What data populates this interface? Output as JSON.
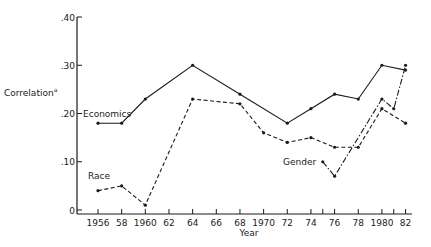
{
  "chart_data": {
    "type": "line",
    "title": "",
    "xlabel": "Year",
    "ylabel": "Correlation",
    "ylabel_superscript": "a",
    "ylim": [
      0,
      0.4
    ],
    "xlim": [
      1954.5,
      1982.5
    ],
    "grid": false,
    "legend_position": "inline labels",
    "y_ticks": [
      {
        "value": 0,
        "label": "0"
      },
      {
        "value": 0.1,
        "label": ".10"
      },
      {
        "value": 0.2,
        "label": ".20"
      },
      {
        "value": 0.3,
        "label": ".30"
      },
      {
        "value": 0.4,
        "label": ".40"
      }
    ],
    "x_ticks": [
      {
        "value": 1956,
        "label": "1956"
      },
      {
        "value": 1958,
        "label": "58"
      },
      {
        "value": 1960,
        "label": "1960"
      },
      {
        "value": 1962,
        "label": "62"
      },
      {
        "value": 1964,
        "label": "64"
      },
      {
        "value": 1966,
        "label": "66"
      },
      {
        "value": 1968,
        "label": "68"
      },
      {
        "value": 1970,
        "label": "1970"
      },
      {
        "value": 1972,
        "label": "72"
      },
      {
        "value": 1974,
        "label": "74"
      },
      {
        "value": 1975,
        "label": ""
      },
      {
        "value": 1976,
        "label": "76"
      },
      {
        "value": 1978,
        "label": "78"
      },
      {
        "value": 1980,
        "label": "1980"
      },
      {
        "value": 1981,
        "label": ""
      },
      {
        "value": 1982,
        "label": "82"
      }
    ],
    "series": [
      {
        "name": "Economics",
        "style": "solid",
        "x": [
          1956,
          1958,
          1960,
          1964,
          1968,
          1972,
          1974,
          1976,
          1978,
          1980,
          1982
        ],
        "values": [
          0.18,
          0.18,
          0.23,
          0.3,
          0.24,
          0.18,
          0.21,
          0.24,
          0.23,
          0.3,
          0.29
        ],
        "label_pos": {
          "x": 1956,
          "y": 0.2
        }
      },
      {
        "name": "Race",
        "style": "dashed",
        "x": [
          1956,
          1958,
          1960,
          1964,
          1968,
          1970,
          1972,
          1974,
          1976,
          1978,
          1980,
          1982
        ],
        "values": [
          0.04,
          0.05,
          0.01,
          0.23,
          0.22,
          0.16,
          0.14,
          0.15,
          0.13,
          0.13,
          0.21,
          0.18
        ],
        "label_pos": {
          "x": 1956,
          "y": 0.06
        }
      },
      {
        "name": "Gender",
        "style": "dash-dot",
        "x": [
          1975,
          1976,
          1980,
          1981,
          1982
        ],
        "values": [
          0.1,
          0.07,
          0.23,
          0.21,
          0.3
        ],
        "label_pos": {
          "x": 1974.7,
          "y": 0.1
        }
      }
    ]
  },
  "colors": {
    "line": "#1a1a1a",
    "background": "#ffffff"
  }
}
